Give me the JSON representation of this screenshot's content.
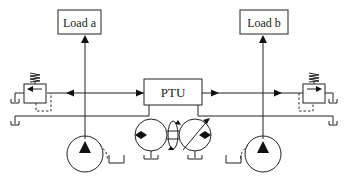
{
  "diagram": {
    "type": "hydraulic-schematic",
    "nodes": {
      "load_a": {
        "label": "Load a"
      },
      "load_b": {
        "label": "Load b"
      },
      "ptu": {
        "label": "PTU"
      },
      "pump_a": {
        "label": ""
      },
      "pump_b": {
        "label": ""
      },
      "relief_valve_a": {
        "label": ""
      },
      "relief_valve_b": {
        "label": ""
      },
      "ptu_motor_pump_pair": {
        "label": ""
      }
    },
    "edges": [
      {
        "from": "pump_a",
        "to": "load_a"
      },
      {
        "from": "pump_b",
        "to": "load_b"
      },
      {
        "from": "pump_a_line",
        "to": "ptu"
      },
      {
        "from": "ptu",
        "to": "pump_b_line"
      },
      {
        "from": "pump_a_line",
        "to": "relief_valve_a"
      },
      {
        "from": "pump_b_line",
        "to": "relief_valve_b"
      }
    ],
    "caption_fragment": ""
  }
}
